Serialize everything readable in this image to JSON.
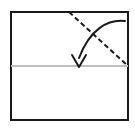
{
  "figure": {
    "kind": "origami-fold-instruction",
    "caption_text": "",
    "background_color": "#ffffff"
  },
  "canvas": {
    "width": 135,
    "height": 129
  },
  "paper_sheet": {
    "name": "paper-outline",
    "shape": "rectangle",
    "x": 11,
    "y": 12,
    "width": 117,
    "height": 108,
    "stroke_color": "#1a1a1a",
    "stroke_width": 2,
    "fill_color": "#ffffff"
  },
  "crease_line": {
    "name": "horizontal-crease",
    "style": "solid",
    "color": "#bfbfbf",
    "stroke_width": 2,
    "x1": 11,
    "y1": 66,
    "x2": 128,
    "y2": 66
  },
  "fold_line": {
    "name": "diagonal-fold-line",
    "style": "dashed",
    "color": "#1a1a1a",
    "stroke_width": 2,
    "dash_pattern": "5 3",
    "x1": 69,
    "y1": 12,
    "x2": 128,
    "y2": 66
  },
  "fold_arrow": {
    "name": "fold-direction-arrow",
    "color": "#1a1a1a",
    "stroke_width": 2,
    "path": "M 125 21 C 108 19 90 29 79 58",
    "arrowhead": {
      "style": "open-v",
      "tip_x": 79,
      "tip_y": 67,
      "left_x": 72,
      "left_y": 55,
      "right_x": 86,
      "right_y": 55,
      "direction": "down"
    }
  }
}
